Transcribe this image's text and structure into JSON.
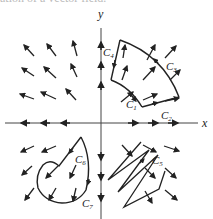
{
  "figure": {
    "cut_caption": "ation of a vector field.",
    "axes": {
      "x_label": "x",
      "y_label": "y"
    },
    "curves": [
      {
        "id": "C1",
        "label": "C",
        "sub": "1"
      },
      {
        "id": "C2",
        "label": "C",
        "sub": "2"
      },
      {
        "id": "C3",
        "label": "C",
        "sub": "3"
      },
      {
        "id": "C4",
        "label": "C",
        "sub": "4"
      },
      {
        "id": "C5",
        "label": "C",
        "sub": "5"
      },
      {
        "id": "C6",
        "label": "C",
        "sub": "6"
      },
      {
        "id": "C7",
        "label": "C",
        "sub": "7"
      }
    ],
    "colors": {
      "ink": "#222222",
      "background": "#ffffff"
    }
  }
}
